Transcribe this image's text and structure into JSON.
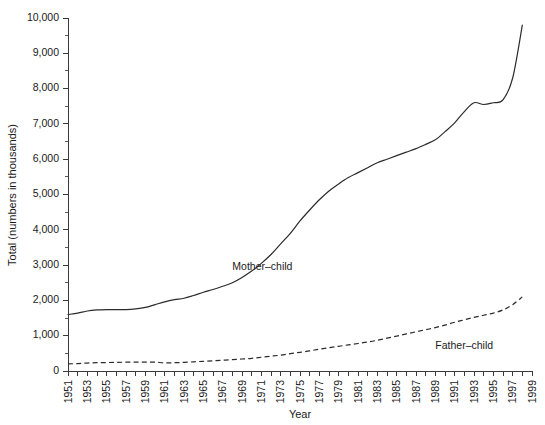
{
  "chart_data": {
    "type": "line",
    "title": "",
    "xlabel": "Year",
    "ylabel": "Total (numbers in thousands)",
    "xlim": [
      1951,
      1999
    ],
    "ylim": [
      0,
      10000
    ],
    "grid": false,
    "legend_position": "inline-annotation",
    "y_ticks_major": [
      0,
      1000,
      2000,
      3000,
      4000,
      5000,
      6000,
      7000,
      8000,
      9000,
      10000
    ],
    "y_tick_labels": [
      "0",
      "1,000",
      "2,000",
      "3,000",
      "4,000",
      "5,000",
      "6,000",
      "7,000",
      "8,000",
      "9,000",
      "10,000"
    ],
    "y_ticks_minor_step": 500,
    "x_ticks_major_step": 1,
    "x_tick_labels": [
      "1951",
      "1953",
      "1955",
      "1957",
      "1959",
      "1961",
      "1963",
      "1965",
      "1967",
      "1969",
      "1971",
      "1973",
      "1975",
      "1977",
      "1979",
      "1981",
      "1983",
      "1985",
      "1987",
      "1989",
      "1991",
      "1993",
      "1995",
      "1997",
      "1999"
    ],
    "x": [
      1951,
      1952,
      1953,
      1954,
      1955,
      1956,
      1957,
      1958,
      1959,
      1960,
      1961,
      1962,
      1963,
      1964,
      1965,
      1966,
      1967,
      1968,
      1969,
      1970,
      1971,
      1972,
      1973,
      1974,
      1975,
      1976,
      1977,
      1978,
      1979,
      1980,
      1981,
      1982,
      1983,
      1984,
      1985,
      1986,
      1987,
      1988,
      1989,
      1990,
      1991,
      1992,
      1993,
      1994,
      1995,
      1996,
      1997,
      1998
    ],
    "series": [
      {
        "name": "Mother-child",
        "label": "Mother–child",
        "style": "solid",
        "color": "#2b2b2b",
        "annotation_x": 1968,
        "annotation_y": 2850,
        "values": [
          1600,
          1640,
          1700,
          1730,
          1740,
          1740,
          1740,
          1760,
          1800,
          1880,
          1960,
          2020,
          2060,
          2140,
          2230,
          2310,
          2400,
          2500,
          2650,
          2830,
          3050,
          3300,
          3600,
          3900,
          4250,
          4560,
          4850,
          5100,
          5300,
          5480,
          5620,
          5760,
          5900,
          6000,
          6100,
          6200,
          6300,
          6420,
          6550,
          6780,
          7030,
          7350,
          7600,
          7550,
          7600,
          7680,
          8300,
          9800
        ]
      },
      {
        "name": "Father-child",
        "label": "Father–child",
        "style": "dashed",
        "color": "#2b2b2b",
        "annotation_x": 1989,
        "annotation_y": 620,
        "values": [
          200,
          210,
          225,
          235,
          240,
          245,
          250,
          250,
          250,
          250,
          230,
          235,
          245,
          260,
          275,
          290,
          305,
          320,
          340,
          360,
          390,
          420,
          450,
          490,
          530,
          570,
          620,
          660,
          700,
          740,
          780,
          820,
          870,
          930,
          990,
          1050,
          1110,
          1170,
          1230,
          1300,
          1380,
          1450,
          1520,
          1580,
          1640,
          1730,
          1880,
          2100
        ]
      }
    ]
  }
}
